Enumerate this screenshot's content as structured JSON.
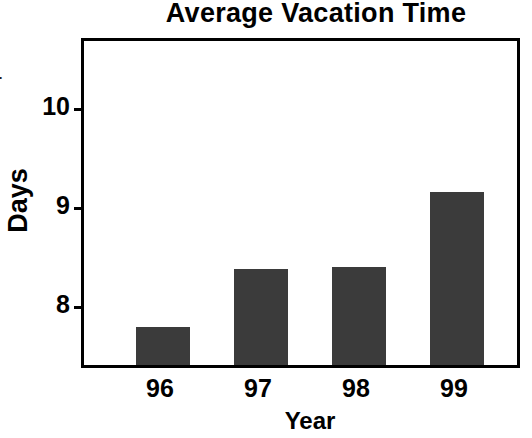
{
  "chart_data": {
    "type": "bar",
    "title": "Average Vacation Time",
    "xlabel": "Year",
    "ylabel": "Days",
    "categories": [
      "96",
      "97",
      "98",
      "99"
    ],
    "values": [
      7.78,
      8.37,
      8.39,
      9.15
    ],
    "series": [
      {
        "name": "Average Vacation Time",
        "values": [
          7.78,
          8.37,
          8.39,
          9.15
        ]
      }
    ],
    "ytick_labels": [
      "10",
      "9",
      "8"
    ],
    "ytick_values": [
      10,
      9,
      8
    ],
    "ylim": [
      7.4,
      10.7
    ],
    "xlim_categories": [
      "96",
      "97",
      "98",
      "99"
    ],
    "grid": false,
    "legend": false,
    "bar_color": "#3b3b3b",
    "axis_color": "#000000",
    "background_color": "#ffffff"
  },
  "margin_fragments": {
    "top_fragment": "s",
    "middle_fragment": "y."
  }
}
